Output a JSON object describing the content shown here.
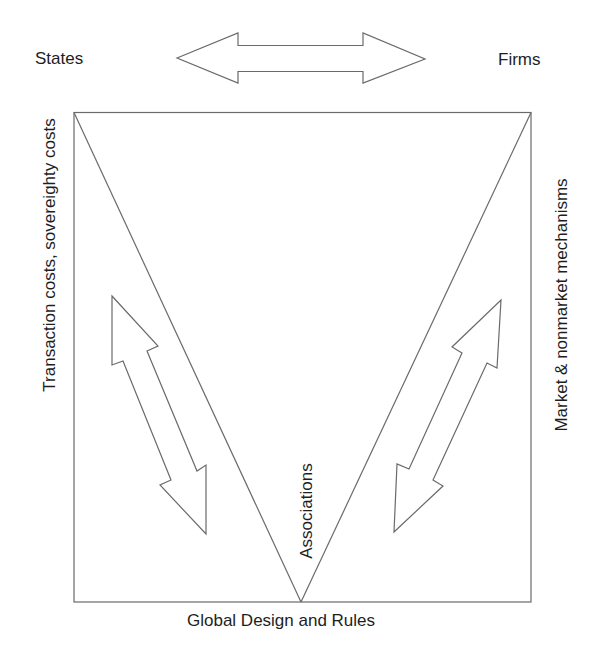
{
  "diagram": {
    "type": "conceptual triangle diagram",
    "corners": {
      "top_left": "States",
      "top_right": "Firms",
      "bottom": "Global Design and Rules"
    },
    "edge_labels": {
      "left": "Transaction costs, sovereighty costs",
      "right": "Market & nonmarket mechanisms",
      "apex_inner": "Associations"
    },
    "arrows": [
      {
        "name": "states-firms",
        "direction": "bidirectional",
        "orientation": "horizontal"
      },
      {
        "name": "states-global-rules",
        "direction": "bidirectional",
        "orientation": "diagonal-left"
      },
      {
        "name": "firms-global-rules",
        "direction": "bidirectional",
        "orientation": "diagonal-right"
      }
    ],
    "colors": {
      "line": "#6a6a6a",
      "text": "#1e1e1e",
      "background": "#ffffff"
    }
  }
}
